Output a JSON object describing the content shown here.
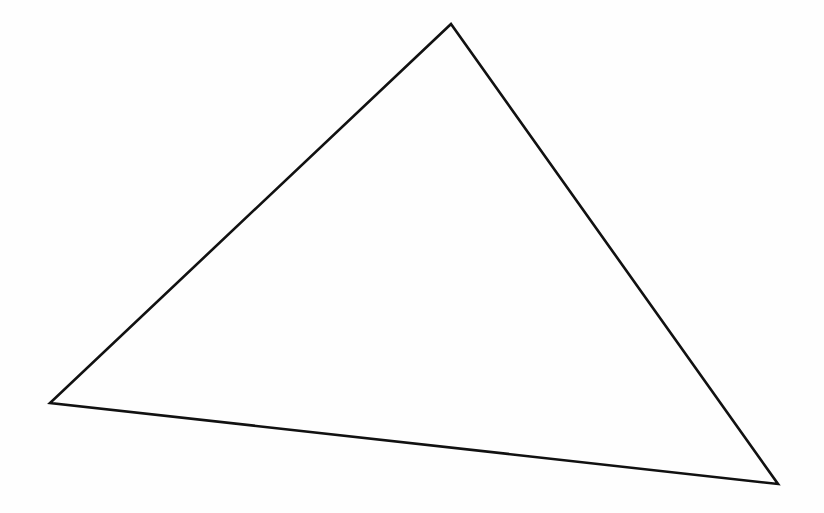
{
  "diagram": {
    "type": "triangle",
    "stroke_color": "#111111",
    "stroke_width": 2.6,
    "fill": "none",
    "background": "#fefefe",
    "vertices": [
      {
        "name": "top",
        "x": 451,
        "y": 24
      },
      {
        "name": "left",
        "x": 50,
        "y": 403
      },
      {
        "name": "right",
        "x": 778,
        "y": 484
      }
    ]
  }
}
